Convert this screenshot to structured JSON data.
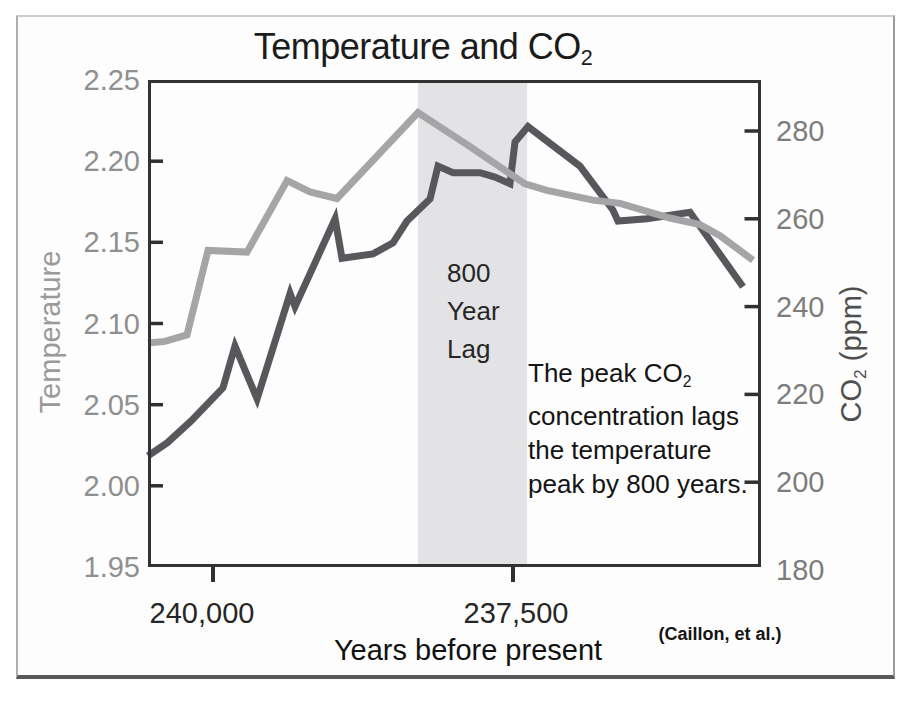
{
  "figure": {
    "title_main": "Temperature and CO",
    "title_sub": "2",
    "x_label": "Years before present",
    "left_axis_label": "Temperature",
    "right_axis_label_pre": "CO",
    "right_axis_label_sub": "2",
    "right_axis_label_post": " (ppm)",
    "credit": "(Caillon, et al.)",
    "lag_label_lines": [
      "800",
      "Year",
      "Lag"
    ],
    "annotation": {
      "line1_pre": "The peak CO",
      "line1_sub": "2",
      "line2": "concentration lags",
      "line3": "the temperature",
      "line4": "peak by 800 years."
    }
  },
  "chart_data": {
    "type": "line",
    "title": "Temperature and CO2",
    "xlabel": "Years before present",
    "grid": false,
    "legend": "none",
    "x_axis": {
      "unit": "years before present",
      "direction": "values decrease left to right",
      "range_left_to_right": [
        240542,
        235433
      ],
      "ticks": [
        {
          "value": 240000,
          "label": "240,000"
        },
        {
          "value": 237500,
          "label": "237,500"
        }
      ]
    },
    "y_left": {
      "label": "Temperature",
      "range_top_to_bottom": [
        2.25,
        1.95
      ],
      "ticks": [
        "2.25",
        "2.20",
        "2.15",
        "2.10",
        "2.05",
        "2.00",
        "1.95"
      ],
      "tick_values": [
        2.25,
        2.2,
        2.15,
        2.1,
        2.05,
        2.0,
        1.95
      ]
    },
    "y_right": {
      "label": "CO2 (ppm)",
      "range_top_to_bottom": [
        291.6,
        180.7
      ],
      "ticks": [
        "280",
        "260",
        "240",
        "220",
        "200",
        "180"
      ],
      "tick_values": [
        280,
        260,
        240,
        220,
        200,
        180
      ]
    },
    "lag_band": {
      "from_year": 238292,
      "to_year": 237383,
      "label": "800 Year Lag",
      "color": "#e3e3e5"
    },
    "annotation_text": "The peak CO2 concentration lags the temperature peak by 800 years.",
    "credit": "(Caillon, et al.)",
    "series": [
      {
        "name": "Temperature",
        "axis": "left",
        "color": "#a5a5a7",
        "points": [
          [
            240542,
            2.088
          ],
          [
            240400,
            2.089
          ],
          [
            240217,
            2.093
          ],
          [
            240042,
            2.145
          ],
          [
            239717,
            2.144
          ],
          [
            239383,
            2.188
          ],
          [
            239192,
            2.181
          ],
          [
            238967,
            2.177
          ],
          [
            238292,
            2.23
          ],
          [
            237858,
            2.209
          ],
          [
            237400,
            2.186
          ],
          [
            237217,
            2.182
          ],
          [
            236833,
            2.176
          ],
          [
            236608,
            2.174
          ],
          [
            236192,
            2.165
          ],
          [
            235942,
            2.161
          ],
          [
            235775,
            2.154
          ],
          [
            235500,
            2.139
          ]
        ]
      },
      {
        "name": "CO2",
        "axis": "right",
        "color": "#58585c",
        "points": [
          [
            240542,
            206
          ],
          [
            240380,
            209
          ],
          [
            240180,
            214
          ],
          [
            239917,
            221.5
          ],
          [
            239817,
            231
          ],
          [
            239633,
            219
          ],
          [
            239358,
            243
          ],
          [
            239317,
            240
          ],
          [
            238983,
            260
          ],
          [
            238925,
            251
          ],
          [
            238667,
            252
          ],
          [
            238500,
            254.5
          ],
          [
            238383,
            259.5
          ],
          [
            238192,
            264.5
          ],
          [
            238125,
            272
          ],
          [
            238000,
            270.5
          ],
          [
            237775,
            270.5
          ],
          [
            237650,
            269.5
          ],
          [
            237525,
            268
          ],
          [
            237483,
            277.5
          ],
          [
            237375,
            281
          ],
          [
            236942,
            272
          ],
          [
            236667,
            262
          ],
          [
            236625,
            259.5
          ],
          [
            236383,
            260
          ],
          [
            236025,
            261.5
          ],
          [
            235583,
            244.5
          ]
        ]
      }
    ]
  }
}
